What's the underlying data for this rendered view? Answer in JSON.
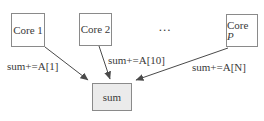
{
  "diagram": {
    "nodes": {
      "core1": {
        "label": "Core 1"
      },
      "core2": {
        "label": "Core 2"
      },
      "ellipsis": "...",
      "coreP": {
        "prefix": "Core ",
        "suffix": "P"
      },
      "sum": {
        "label": "sum"
      }
    },
    "edges": {
      "core1_to_sum": {
        "label": "sum+=A[1]"
      },
      "core2_to_sum": {
        "label": "sum+=A[10]"
      },
      "coreP_to_sum": {
        "label": "sum+=A[N]"
      }
    }
  },
  "colors": {
    "background": "#ffffff",
    "box_fill": "#ffffff",
    "box_border": "#8a8a8a",
    "sum_fill": "#ebebeb",
    "text": "#3a3a3a",
    "arrow": "#4a4a4a"
  }
}
